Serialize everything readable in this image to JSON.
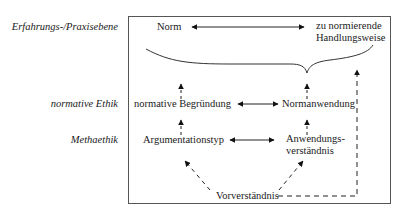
{
  "levels": {
    "experience": "Erfahrungs-/Praxisebene",
    "normative": "normative Ethik",
    "meta": "Methaethik"
  },
  "nodes": {
    "norm": "Norm",
    "action_line1": "zu normierende",
    "action_line2": "Handlungsweise",
    "justification": "normative Begründung",
    "application": "Normanwendung",
    "argument_type": "Argumentationstyp",
    "understanding_line1": "Anwendungs-",
    "understanding_line2": "verständnis",
    "preunderstanding": "Vorverständnis"
  },
  "colors": {
    "line": "#222222",
    "frame": "#555555",
    "text": "#1a1a1a"
  }
}
